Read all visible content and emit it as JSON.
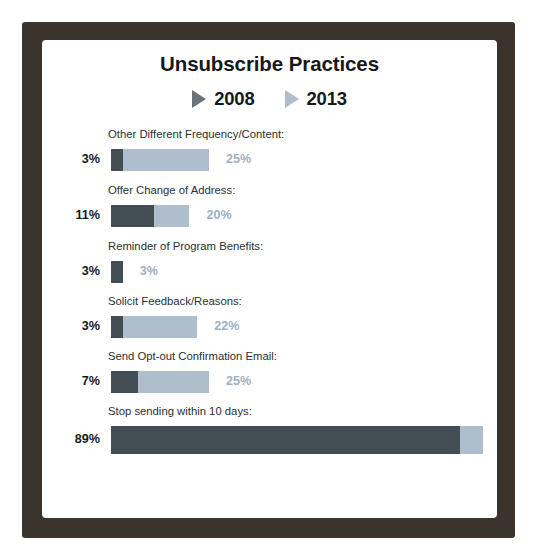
{
  "chart_data": {
    "type": "bar",
    "orientation": "horizontal",
    "title": "Unsubscribe Practices",
    "xlabel": "",
    "ylabel": "",
    "xlim": [
      0,
      100
    ],
    "grid": false,
    "legend_position": "top-center",
    "categories": [
      "Other Different Frequency/Content:",
      "Offer Change of Address:",
      "Reminder of Program Benefits:",
      "Solicit Feedback/Reasons:",
      "Send Opt-out Confirmation Email:",
      "Stop sending within 10 days:"
    ],
    "series": [
      {
        "name": "2008",
        "color": "#434d54",
        "values": [
          3,
          11,
          3,
          3,
          7,
          89
        ],
        "value_labels": [
          "3%",
          "11%",
          "3%",
          "3%",
          "7%",
          "89%"
        ]
      },
      {
        "name": "2013",
        "color": "#aebecd",
        "values": [
          25,
          20,
          3,
          22,
          25,
          95
        ],
        "value_labels": [
          "25%",
          "20%",
          "3%",
          "22%",
          "25%",
          "95%"
        ]
      }
    ]
  },
  "legend": {
    "items": [
      {
        "label": "2008",
        "marker": "triangle-right-icon",
        "color": "#6d737a"
      },
      {
        "label": "2013",
        "marker": "triangle-right-icon",
        "color": "#aebecd"
      }
    ]
  },
  "theme": {
    "frame_color": "#3b342d",
    "card_color": "#ffffff",
    "title_color": "#16191c",
    "dark_bar": "#434d54",
    "light_bar": "#aebecd",
    "right_label_color": "#9fb0c0"
  }
}
